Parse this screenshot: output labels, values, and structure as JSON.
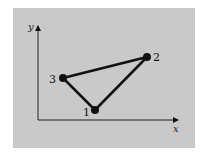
{
  "diagram": {
    "axes": {
      "x_label": "x",
      "y_label": "y"
    },
    "points": [
      {
        "label": "1",
        "x": 95,
        "y": 110
      },
      {
        "label": "2",
        "x": 147,
        "y": 57
      },
      {
        "label": "3",
        "x": 63,
        "y": 78
      }
    ],
    "edges": [
      [
        "1",
        "2"
      ],
      [
        "2",
        "3"
      ],
      [
        "3",
        "1"
      ]
    ],
    "colors": {
      "panel": "#c9c9c9",
      "ink": "#111111"
    }
  }
}
